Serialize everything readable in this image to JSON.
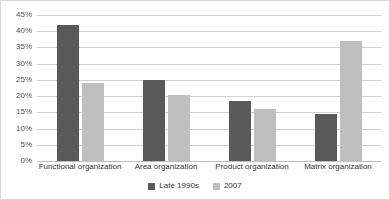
{
  "chart_data": {
    "type": "bar",
    "title": "",
    "xlabel": "",
    "ylabel": "",
    "ylim": [
      0,
      45
    ],
    "ytick_step": 5,
    "grid": true,
    "legend_position": "bottom",
    "categories": [
      "Functional organization",
      "Area organization",
      "Product organization",
      "Matrix organization"
    ],
    "ytick_labels": [
      "0%",
      "5%",
      "10%",
      "15%",
      "20%",
      "25%",
      "30%",
      "35%",
      "40%",
      "45%"
    ],
    "ytick_values": [
      0,
      5,
      10,
      15,
      20,
      25,
      30,
      35,
      40,
      45
    ],
    "series": [
      {
        "name": "Late 1990s",
        "color": "#595959",
        "values": [
          42,
          25,
          18.5,
          14.5
        ]
      },
      {
        "name": "2007",
        "color": "#bfbfbf",
        "values": [
          24,
          20.5,
          16,
          37
        ]
      }
    ]
  },
  "colors": {
    "series_late_1990s": "#595959",
    "series_2007": "#bfbfbf",
    "gridline": "#d0d0d0",
    "frame_border": "#d9d9d9",
    "tick_text": "#555555",
    "label_text": "#333333",
    "background": "#ffffff"
  }
}
